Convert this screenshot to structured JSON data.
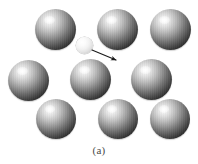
{
  "figure": {
    "caption": "(a)",
    "background_color": "#ffffff",
    "width": 198,
    "height": 164,
    "description_label": "atomic-lattice-with-moving-particle"
  },
  "palette": {
    "sphere_highlight": "#ffffff",
    "sphere_midtone": "#9a9a9a",
    "sphere_shadow": "#000000",
    "small_sphere_fill": "#f2f2f2",
    "arrow_color": "#1a1a1a",
    "caption_color": "#4a4a4a"
  },
  "lattice": {
    "name": "large-atoms",
    "atom_diameter": 41,
    "rows": [
      {
        "row_label": "top-row",
        "atoms": [
          {
            "label": "atom-1",
            "x": 35,
            "y": 9,
            "d": 41
          },
          {
            "label": "atom-2",
            "x": 97,
            "y": 9,
            "d": 41
          },
          {
            "label": "atom-3",
            "x": 150,
            "y": 9,
            "d": 41
          }
        ]
      },
      {
        "row_label": "middle-row",
        "atoms": [
          {
            "label": "atom-4",
            "x": 8,
            "y": 60,
            "d": 41
          },
          {
            "label": "atom-5",
            "x": 70,
            "y": 59,
            "d": 41
          },
          {
            "label": "atom-6",
            "x": 131,
            "y": 59,
            "d": 41
          }
        ]
      },
      {
        "row_label": "bottom-row",
        "atoms": [
          {
            "label": "atom-7",
            "x": 36,
            "y": 99,
            "d": 40
          },
          {
            "label": "atom-8",
            "x": 98,
            "y": 99,
            "d": 40
          },
          {
            "label": "atom-9",
            "x": 150,
            "y": 99,
            "d": 40
          }
        ]
      }
    ]
  },
  "particle": {
    "name": "small-moving-particle",
    "x": 76,
    "y": 37,
    "d": 17
  },
  "arrow": {
    "name": "motion-direction-arrow",
    "x1": 92,
    "y1": 50,
    "x2": 116,
    "y2": 60,
    "head_size": 5,
    "stroke_width": 1.1
  }
}
